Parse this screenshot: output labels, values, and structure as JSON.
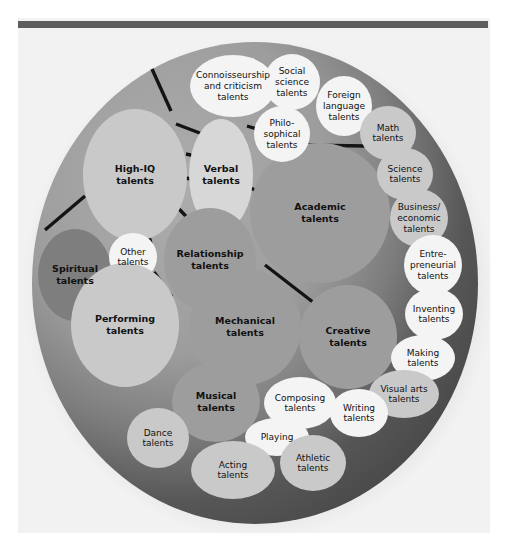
{
  "figure": {
    "colors": {
      "page_background": "#ffffff",
      "panel_background": "#f2f2f2",
      "top_rule": "#5d5d5d",
      "outer_ring_dark": "#4d4d4d",
      "outer_ring_light": "#9b9b9b",
      "bubble_mid": "#9d9d9d",
      "bubble_light": "#c9c9c9",
      "bubble_pale": "#d7d7d7",
      "bubble_white": "#f4f4f4",
      "bubble_dark": "#7e7e7e",
      "connector_line": "#141414",
      "label_text": "#111111"
    }
  },
  "chart_data": {
    "type": "bubble",
    "xlabel": "",
    "ylabel": "",
    "grid": false,
    "legend": "none",
    "nodes": [
      {
        "id": "high-iq",
        "label_lines": [
          "High-IQ",
          "talents"
        ],
        "tier": "primary",
        "shade": "light",
        "cx": 135,
        "cy": 175,
        "rx": 52,
        "ry": 66,
        "bold": true,
        "font": 9.5
      },
      {
        "id": "verbal",
        "label_lines": [
          "Verbal",
          "talents"
        ],
        "tier": "primary",
        "shade": "pale",
        "cx": 221,
        "cy": 175,
        "rx": 32,
        "ry": 56,
        "bold": true,
        "font": 9.5
      },
      {
        "id": "academic",
        "label_lines": [
          "Academic",
          "talents"
        ],
        "tier": "primary",
        "shade": "mid",
        "cx": 320,
        "cy": 213,
        "rx": 70,
        "ry": 70,
        "bold": true,
        "font": 9.5
      },
      {
        "id": "relationship",
        "label_lines": [
          "Relationship",
          "talents"
        ],
        "tier": "primary",
        "shade": "mid",
        "cx": 210,
        "cy": 260,
        "rx": 46,
        "ry": 52,
        "bold": true,
        "font": 9.5
      },
      {
        "id": "spiritual",
        "label_lines": [
          "Spiritual",
          "talents"
        ],
        "tier": "primary",
        "shade": "dark",
        "cx": 75,
        "cy": 275,
        "rx": 37,
        "ry": 46,
        "bold": true,
        "font": 9.5
      },
      {
        "id": "other",
        "label_lines": [
          "Other",
          "talents"
        ],
        "tier": "secondary",
        "shade": "white",
        "cx": 133,
        "cy": 257,
        "rx": 24,
        "ry": 24,
        "bold": false,
        "font": 9
      },
      {
        "id": "performing",
        "label_lines": [
          "Performing",
          "talents"
        ],
        "tier": "primary",
        "shade": "light",
        "cx": 125,
        "cy": 325,
        "rx": 54,
        "ry": 62,
        "bold": true,
        "font": 9.5
      },
      {
        "id": "mechanical",
        "label_lines": [
          "Mechanical",
          "talents"
        ],
        "tier": "primary",
        "shade": "mid",
        "cx": 245,
        "cy": 327,
        "rx": 56,
        "ry": 58,
        "bold": true,
        "font": 9.5
      },
      {
        "id": "creative",
        "label_lines": [
          "Creative",
          "talents"
        ],
        "tier": "primary",
        "shade": "mid",
        "cx": 348,
        "cy": 337,
        "rx": 49,
        "ry": 52,
        "bold": true,
        "font": 9.5
      },
      {
        "id": "musical",
        "label_lines": [
          "Musical",
          "talents"
        ],
        "tier": "primary",
        "shade": "mid",
        "cx": 216,
        "cy": 402,
        "rx": 44,
        "ry": 40,
        "bold": true,
        "font": 9.5
      },
      {
        "id": "connoisseurship",
        "label_lines": [
          "Connoisseurship",
          "and criticism",
          "talents"
        ],
        "tier": "secondary",
        "shade": "white",
        "cx": 233,
        "cy": 86,
        "rx": 43,
        "ry": 31,
        "bold": false,
        "font": 9
      },
      {
        "id": "social-science",
        "label_lines": [
          "Social",
          "science",
          "talents"
        ],
        "tier": "secondary",
        "shade": "white",
        "cx": 292,
        "cy": 82,
        "rx": 28,
        "ry": 28,
        "bold": false,
        "font": 9
      },
      {
        "id": "philosophical",
        "label_lines": [
          "Philo-",
          "sophical",
          "talents"
        ],
        "tier": "secondary",
        "shade": "white",
        "cx": 282,
        "cy": 134,
        "rx": 28,
        "ry": 28,
        "bold": false,
        "font": 9
      },
      {
        "id": "foreign-language",
        "label_lines": [
          "Foreign",
          "language",
          "talents"
        ],
        "tier": "secondary",
        "shade": "white",
        "cx": 344,
        "cy": 106,
        "rx": 28,
        "ry": 30,
        "bold": false,
        "font": 9
      },
      {
        "id": "math",
        "label_lines": [
          "Math",
          "talents"
        ],
        "tier": "secondary",
        "shade": "light",
        "cx": 388,
        "cy": 133,
        "rx": 28,
        "ry": 27,
        "bold": false,
        "font": 9
      },
      {
        "id": "science",
        "label_lines": [
          "Science",
          "talents"
        ],
        "tier": "secondary",
        "shade": "light",
        "cx": 405,
        "cy": 174,
        "rx": 28,
        "ry": 26,
        "bold": false,
        "font": 9
      },
      {
        "id": "business-economic",
        "label_lines": [
          "Business/",
          "economic",
          "talents"
        ],
        "tier": "secondary",
        "shade": "light",
        "cx": 419,
        "cy": 218,
        "rx": 29,
        "ry": 29,
        "bold": false,
        "font": 9
      },
      {
        "id": "entrepreneurial",
        "label_lines": [
          "Entre-",
          "preneurial",
          "talents"
        ],
        "tier": "secondary",
        "shade": "white",
        "cx": 433,
        "cy": 265,
        "rx": 29,
        "ry": 30,
        "bold": false,
        "font": 9
      },
      {
        "id": "inventing",
        "label_lines": [
          "Inventing",
          "talents"
        ],
        "tier": "secondary",
        "shade": "white",
        "cx": 434,
        "cy": 314,
        "rx": 29,
        "ry": 26,
        "bold": false,
        "font": 9
      },
      {
        "id": "making",
        "label_lines": [
          "Making",
          "talents"
        ],
        "tier": "secondary",
        "shade": "white",
        "cx": 423,
        "cy": 358,
        "rx": 32,
        "ry": 23,
        "bold": false,
        "font": 9
      },
      {
        "id": "visual-arts",
        "label_lines": [
          "Visual arts",
          "talents"
        ],
        "tier": "secondary",
        "shade": "light",
        "cx": 404,
        "cy": 394,
        "rx": 35,
        "ry": 24,
        "bold": false,
        "font": 9
      },
      {
        "id": "writing",
        "label_lines": [
          "Writing",
          "talents"
        ],
        "tier": "secondary",
        "shade": "white",
        "cx": 359,
        "cy": 413,
        "rx": 29,
        "ry": 24,
        "bold": false,
        "font": 9
      },
      {
        "id": "composing",
        "label_lines": [
          "Composing",
          "talents"
        ],
        "tier": "secondary",
        "shade": "white",
        "cx": 300,
        "cy": 403,
        "rx": 36,
        "ry": 26,
        "bold": false,
        "font": 9
      },
      {
        "id": "playing",
        "label_lines": [
          "Playing"
        ],
        "tier": "secondary",
        "shade": "white",
        "cx": 277,
        "cy": 437,
        "rx": 32,
        "ry": 19,
        "bold": false,
        "font": 9
      },
      {
        "id": "dance",
        "label_lines": [
          "Dance",
          "talents"
        ],
        "tier": "secondary",
        "shade": "light",
        "cx": 158,
        "cy": 438,
        "rx": 31,
        "ry": 30,
        "bold": false,
        "font": 9
      },
      {
        "id": "acting",
        "label_lines": [
          "Acting",
          "talents"
        ],
        "tier": "secondary",
        "shade": "light",
        "cx": 233,
        "cy": 470,
        "rx": 42,
        "ry": 29,
        "bold": false,
        "font": 9
      },
      {
        "id": "athletic",
        "label_lines": [
          "Athletic",
          "talents"
        ],
        "tier": "secondary",
        "shade": "light",
        "cx": 313,
        "cy": 463,
        "rx": 33,
        "ry": 28,
        "bold": false,
        "font": 9
      }
    ],
    "connectors": [
      {
        "id": "conn-1",
        "x1": 152,
        "y1": 69,
        "x2": 171,
        "y2": 111
      },
      {
        "id": "conn-2",
        "x1": 176,
        "y1": 124,
        "x2": 205,
        "y2": 135
      },
      {
        "id": "conn-3",
        "x1": 186,
        "y1": 154,
        "x2": 200,
        "y2": 157
      },
      {
        "id": "conn-4",
        "x1": 186,
        "y1": 178,
        "x2": 200,
        "y2": 181
      },
      {
        "id": "conn-5",
        "x1": 247,
        "y1": 126,
        "x2": 263,
        "y2": 131
      },
      {
        "id": "conn-6",
        "x1": 249,
        "y1": 187,
        "x2": 278,
        "y2": 202
      },
      {
        "id": "conn-7",
        "x1": 179,
        "y1": 209,
        "x2": 205,
        "y2": 236
      },
      {
        "id": "conn-8",
        "x1": 145,
        "y1": 221,
        "x2": 151,
        "y2": 244
      },
      {
        "id": "conn-9",
        "x1": 45,
        "y1": 230,
        "x2": 85,
        "y2": 196
      },
      {
        "id": "conn-10",
        "x1": 154,
        "y1": 272,
        "x2": 172,
        "y2": 297
      },
      {
        "id": "conn-11",
        "x1": 265,
        "y1": 265,
        "x2": 318,
        "y2": 306
      },
      {
        "id": "conn-12",
        "x1": 300,
        "y1": 145,
        "x2": 366,
        "y2": 146
      }
    ]
  },
  "labels": {
    "high_iq": "High-IQ talents",
    "verbal": "Verbal talents",
    "academic": "Academic talents",
    "relationship": "Relationship talents",
    "spiritual": "Spiritual talents",
    "other": "Other talents",
    "performing": "Performing talents",
    "mechanical": "Mechanical talents",
    "creative": "Creative talents",
    "musical": "Musical talents",
    "connoisseurship": "Connoisseurship and criticism talents",
    "social_science": "Social science talents",
    "philosophical": "Philosophical talents",
    "foreign_language": "Foreign language talents",
    "math": "Math talents",
    "science": "Science talents",
    "business_economic": "Business/economic talents",
    "entrepreneurial": "Entrepreneurial talents",
    "inventing": "Inventing talents",
    "making": "Making talents",
    "visual_arts": "Visual arts talents",
    "writing": "Writing talents",
    "composing": "Composing talents",
    "playing": "Playing",
    "dance": "Dance talents",
    "acting": "Acting talents",
    "athletic": "Athletic talents"
  }
}
